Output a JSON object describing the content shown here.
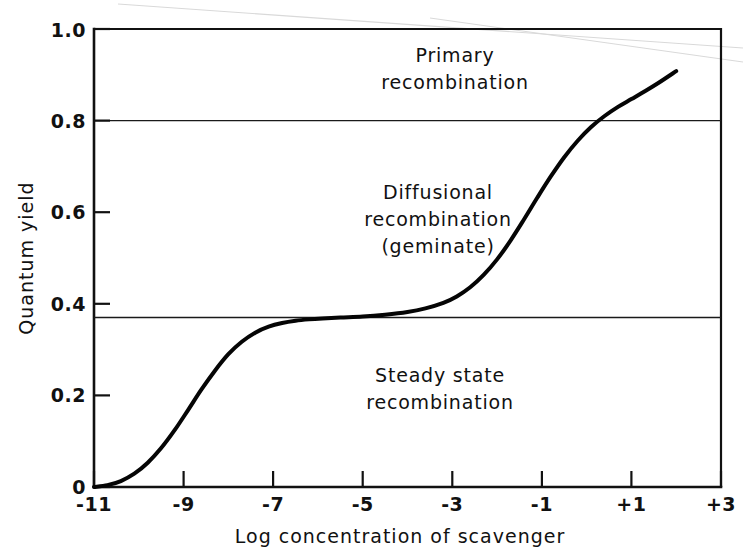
{
  "chart_data": {
    "type": "line",
    "title": "",
    "xlabel": "Log concentration of scavenger",
    "ylabel": "Quantum yield",
    "xlim": [
      -11,
      3
    ],
    "ylim": [
      0,
      1.0
    ],
    "grid": false,
    "legend": "none",
    "xticklabels": [
      "-11",
      "-9",
      "-7",
      "-5",
      "-3",
      "-1",
      "+1",
      "+3"
    ],
    "xtickvalues": [
      -11,
      -9,
      -7,
      -5,
      -3,
      -1,
      1,
      3
    ],
    "yticklabels": [
      "0",
      "0.2",
      "0.4",
      "0.6",
      "0.8",
      "1.0"
    ],
    "ytickvalues": [
      0,
      0.2,
      0.4,
      0.6,
      0.8,
      1.0
    ],
    "series": [
      {
        "name": "Quantum yield vs log scavenger concentration",
        "x": [
          -11.0,
          -10.7,
          -10.4,
          -10.1,
          -9.8,
          -9.5,
          -9.2,
          -8.9,
          -8.6,
          -8.3,
          -8.0,
          -7.7,
          -7.4,
          -7.1,
          -6.8,
          -6.5,
          -6.2,
          -5.9,
          -5.5,
          -5.0,
          -4.5,
          -4.0,
          -3.6,
          -3.2,
          -2.9,
          -2.6,
          -2.3,
          -2.0,
          -1.7,
          -1.4,
          -1.1,
          -0.8,
          -0.5,
          -0.2,
          0.1,
          0.4,
          0.7,
          1.0,
          1.3,
          1.6,
          2.0
        ],
        "y": [
          0.0,
          0.004,
          0.013,
          0.029,
          0.053,
          0.085,
          0.124,
          0.168,
          0.213,
          0.254,
          0.29,
          0.317,
          0.337,
          0.35,
          0.358,
          0.363,
          0.366,
          0.368,
          0.37,
          0.372,
          0.376,
          0.382,
          0.39,
          0.402,
          0.416,
          0.436,
          0.463,
          0.497,
          0.538,
          0.584,
          0.632,
          0.678,
          0.72,
          0.756,
          0.786,
          0.81,
          0.83,
          0.847,
          0.864,
          0.882,
          0.908
        ]
      }
    ],
    "reference_lines": [
      {
        "name": "primary-boundary",
        "y": 0.8,
        "orientation": "horizontal"
      },
      {
        "name": "diffusional-boundary",
        "y": 0.37,
        "orientation": "horizontal"
      }
    ],
    "region_annotations": [
      {
        "id": "primary",
        "lines": [
          "Primary",
          "recombination"
        ],
        "y_center": 0.9
      },
      {
        "id": "diffusional",
        "lines": [
          "Diffusional",
          "recombination",
          "(geminate)"
        ],
        "y_center": 0.58
      },
      {
        "id": "steady-state",
        "lines": [
          "Steady state",
          "recombination"
        ],
        "y_center": 0.18
      }
    ]
  }
}
